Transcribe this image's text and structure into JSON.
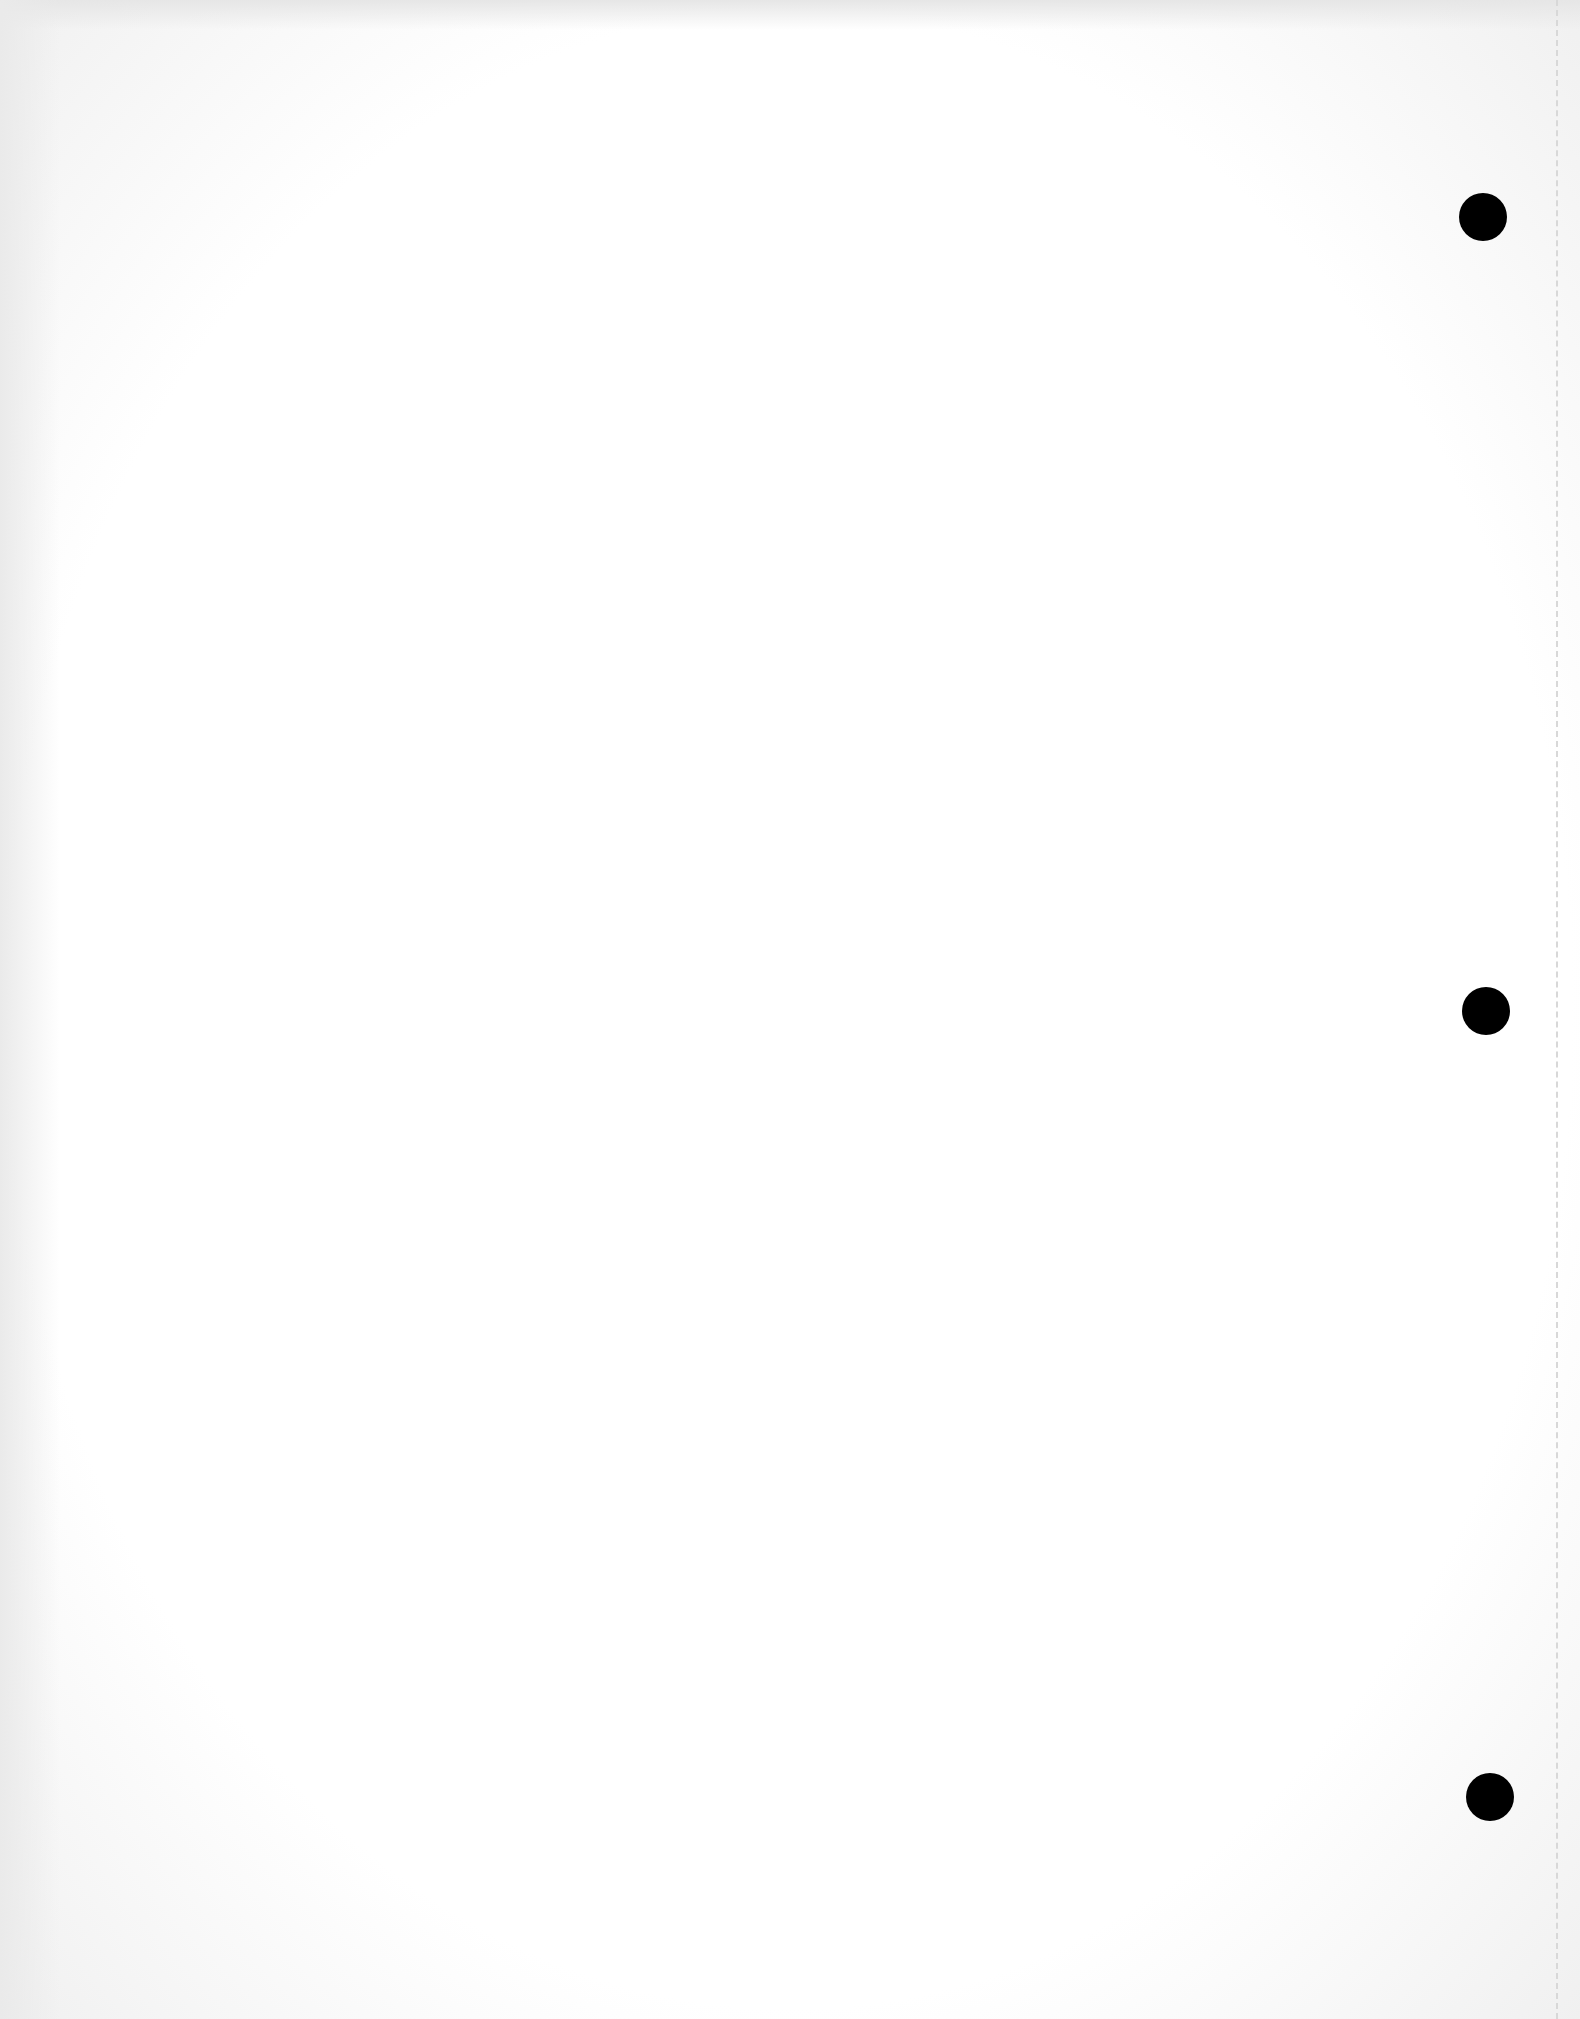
{
  "page": {
    "type": "blank-punched-sheet",
    "punch_holes": [
      {
        "x": 1459,
        "y": 193
      },
      {
        "x": 1462,
        "y": 987
      },
      {
        "x": 1466,
        "y": 1773
      }
    ]
  }
}
